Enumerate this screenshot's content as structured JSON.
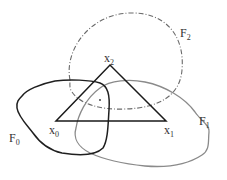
{
  "diagram": {
    "type": "set-covering-simplex",
    "colors": {
      "triangle": "#1a1a1a",
      "F0": "#1f1f1f",
      "F1": "#8a8a8a",
      "F2": "#666666",
      "text": "#333333"
    },
    "vertices": [
      {
        "id": "x0",
        "base": "x",
        "sub": "0",
        "x": 56,
        "y": 121
      },
      {
        "id": "x1",
        "base": "x",
        "sub": "1",
        "x": 166,
        "y": 121
      },
      {
        "id": "x2",
        "base": "x",
        "sub": "2",
        "x": 110,
        "y": 65
      }
    ],
    "sets": [
      {
        "id": "F0",
        "base": "F",
        "sub": "0",
        "style": "solid-dark"
      },
      {
        "id": "F1",
        "base": "F",
        "sub": "1",
        "style": "solid-gray"
      },
      {
        "id": "F2",
        "base": "F",
        "sub": "2",
        "style": "dash-dot"
      }
    ],
    "labels": {
      "x0": {
        "base": "x",
        "sub": "0"
      },
      "x1": {
        "base": "x",
        "sub": "1"
      },
      "x2": {
        "base": "x",
        "sub": "2"
      },
      "F0": {
        "base": "F",
        "sub": "0"
      },
      "F1": {
        "base": "F",
        "sub": "1"
      },
      "F2": {
        "base": "F",
        "sub": "2"
      }
    }
  }
}
